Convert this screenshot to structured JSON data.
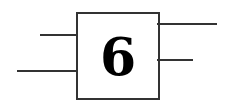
{
  "diagram": {
    "type": "block",
    "block": {
      "label": "6",
      "border_color": "#333333",
      "x": 76,
      "y": 12,
      "width": 84,
      "height": 88
    },
    "inputs": [
      {
        "name": "input-1",
        "x1": 40,
        "x2": 76,
        "y": 35
      },
      {
        "name": "input-2",
        "x1": 17,
        "x2": 76,
        "y": 71
      }
    ],
    "outputs": [
      {
        "name": "output-1",
        "x1": 158,
        "x2": 217,
        "y": 24
      },
      {
        "name": "output-2",
        "x1": 158,
        "x2": 193,
        "y": 60
      }
    ],
    "line_color": "#333333"
  }
}
